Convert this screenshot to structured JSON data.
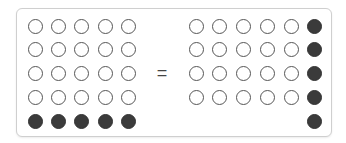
{
  "diagram": {
    "symbol": "=",
    "colors": {
      "filled": "#3b3b3b",
      "outline": "#555555",
      "frame": "#cfcfcf"
    },
    "left_group": {
      "rows": [
        [
          "empty",
          "empty",
          "empty",
          "empty",
          "empty"
        ],
        [
          "empty",
          "empty",
          "empty",
          "empty",
          "empty"
        ],
        [
          "empty",
          "empty",
          "empty",
          "empty",
          "empty"
        ],
        [
          "empty",
          "empty",
          "empty",
          "empty",
          "empty"
        ],
        [
          "filled",
          "filled",
          "filled",
          "filled",
          "filled"
        ]
      ]
    },
    "right_group": {
      "rows": [
        [
          "empty",
          "empty",
          "empty",
          "empty",
          "empty",
          "filled"
        ],
        [
          "empty",
          "empty",
          "empty",
          "empty",
          "empty",
          "filled"
        ],
        [
          "empty",
          "empty",
          "empty",
          "empty",
          "empty",
          "filled"
        ],
        [
          "empty",
          "empty",
          "empty",
          "empty",
          "empty",
          "filled"
        ],
        [
          "none",
          "none",
          "none",
          "none",
          "none",
          "filled"
        ]
      ]
    }
  }
}
